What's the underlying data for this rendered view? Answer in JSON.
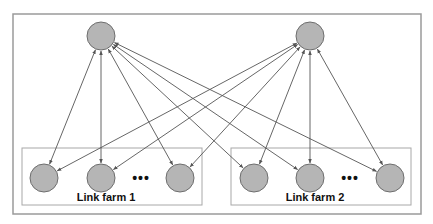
{
  "diagram": {
    "colors": {
      "node_fill": "#b5b5b5",
      "node_stroke": "#6e6e6e",
      "edge": "#555555",
      "frame": "#9a9a9a",
      "farm_box": "#a8a8a8"
    },
    "top_nodes": [
      {
        "id": "hub-1",
        "cx": 101,
        "cy": 36
      },
      {
        "id": "hub-2",
        "cx": 310,
        "cy": 36
      }
    ],
    "farms": [
      {
        "label": "Link farm 1",
        "box": {
          "x": 22,
          "y": 148,
          "w": 180,
          "h": 57
        },
        "nodes": [
          {
            "id": "f1-n1",
            "cx": 44,
            "cy": 178
          },
          {
            "id": "f1-n2",
            "cx": 101,
            "cy": 178
          },
          {
            "id": "f1-n3",
            "cx": 180,
            "cy": 178
          }
        ],
        "ellipsis": "•••",
        "ellipsis_pos": {
          "x": 141,
          "y": 183
        },
        "label_pos": {
          "x": 106,
          "y": 201
        }
      },
      {
        "label": "Link farm 2",
        "box": {
          "x": 231,
          "y": 148,
          "w": 180,
          "h": 57
        },
        "nodes": [
          {
            "id": "f2-n1",
            "cx": 254,
            "cy": 178
          },
          {
            "id": "f2-n2",
            "cx": 310,
            "cy": 178
          },
          {
            "id": "f2-n3",
            "cx": 390,
            "cy": 178
          }
        ],
        "ellipsis": "•••",
        "ellipsis_pos": {
          "x": 350,
          "y": 183
        },
        "label_pos": {
          "x": 315,
          "y": 201
        }
      }
    ],
    "edges_note": "Each hub node has bidirectional arrows to every node in both link farms",
    "node_radius": 14
  }
}
